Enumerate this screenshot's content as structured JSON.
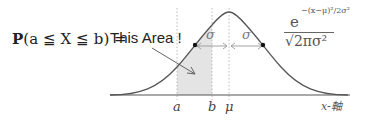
{
  "formula": {
    "lhs": "P(a ≦ X ≦ b) =",
    "P": "P",
    "rest": "(a ≦ X ≦ b) ="
  },
  "annotation": "This Area !",
  "pdf": {
    "base": "e",
    "exponent": "−(x−μ)²/2σ²",
    "denominator": "√2πσ²"
  },
  "axis": {
    "label": "x-軸",
    "ticks": [
      {
        "label": "a",
        "x": 177
      },
      {
        "label": "b",
        "x": 212
      },
      {
        "label": "μ",
        "x": 229
      }
    ]
  },
  "sigma_labels": [
    "σ",
    "σ"
  ],
  "colors": {
    "curve": "#555555",
    "shade": "#e4e4e4",
    "axis": "#555555",
    "dotted": "#aaaaaa",
    "arrow": "#999999"
  }
}
